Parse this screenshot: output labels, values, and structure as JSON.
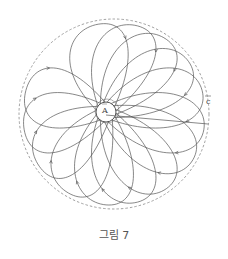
{
  "figure": {
    "caption": "그림 7",
    "labels": {
      "point_a": "A",
      "vector_c": "c"
    },
    "colors": {
      "stroke": "#555555",
      "dashed_circle": "#888888",
      "background": "#ffffff"
    },
    "outer_circle": {
      "cx": 114,
      "cy": 114,
      "r": 95,
      "style": "dashed"
    },
    "inner_circle": {
      "cx": 106,
      "cy": 112,
      "r": 10
    },
    "loop_count": 14,
    "loop_tip_angles_deg": [
      -100,
      -75,
      -55,
      -35,
      -15,
      10,
      30,
      55,
      75,
      95,
      120,
      145,
      170,
      195
    ]
  }
}
